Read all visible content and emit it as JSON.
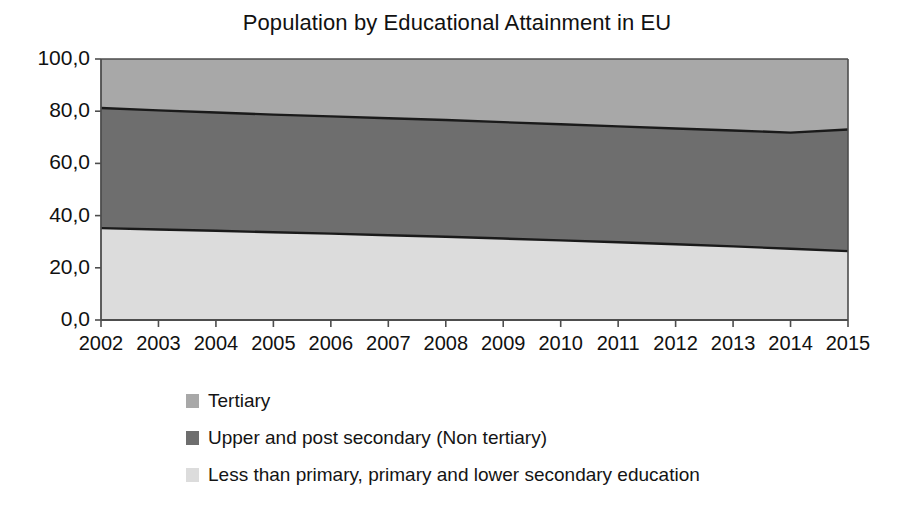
{
  "chart_data": {
    "type": "area",
    "title": "Population by Educational Attainment in EU",
    "subtitle": "",
    "xlabel": "",
    "ylabel": "",
    "stacked": true,
    "normalized_percent": true,
    "grid": false,
    "legend_position": "bottom",
    "xlim": [
      2002,
      2015
    ],
    "ylim": [
      0,
      100
    ],
    "y_ticks": [
      "0,0",
      "20,0",
      "40,0",
      "60,0",
      "80,0",
      "100,0"
    ],
    "y_tick_values": [
      0,
      20,
      40,
      60,
      80,
      100
    ],
    "x": [
      2002,
      2003,
      2004,
      2005,
      2006,
      2007,
      2008,
      2009,
      2010,
      2011,
      2012,
      2013,
      2014,
      2015
    ],
    "categories": [
      "2002",
      "2003",
      "2004",
      "2005",
      "2006",
      "2007",
      "2008",
      "2009",
      "2010",
      "2011",
      "2012",
      "2013",
      "2014",
      "2015"
    ],
    "series": [
      {
        "name": "Less than primary, primary and lower secondary education",
        "color": "#dcdcdc",
        "values": [
          35.2,
          34.7,
          34.2,
          33.6,
          33.1,
          32.5,
          31.9,
          31.2,
          30.5,
          29.8,
          29.0,
          28.2,
          27.3,
          26.4
        ]
      },
      {
        "name": "Upper and post secondary (Non tertiary)",
        "color": "#6e6e6e",
        "values": [
          46.0,
          45.6,
          45.3,
          45.1,
          44.9,
          44.8,
          44.7,
          44.6,
          44.5,
          44.4,
          44.4,
          44.4,
          44.5,
          46.6
        ]
      },
      {
        "name": "Tertiary",
        "color": "#a8a8a8",
        "values": [
          18.8,
          19.7,
          20.5,
          21.3,
          22.0,
          22.7,
          23.4,
          24.2,
          25.0,
          25.8,
          26.6,
          27.4,
          28.2,
          27.0
        ]
      }
    ],
    "cumulative_upper_boundary": [
      81.2,
      80.3,
      79.5,
      78.7,
      78.0,
      77.3,
      76.6,
      75.8,
      75.0,
      74.2,
      73.4,
      72.6,
      71.8,
      73.0
    ],
    "cumulative_lower_boundary": [
      35.2,
      34.7,
      34.2,
      33.6,
      33.1,
      32.5,
      31.9,
      31.2,
      30.5,
      29.8,
      29.0,
      28.2,
      27.3,
      26.4
    ]
  },
  "legend": {
    "items": [
      {
        "label": "Tertiary",
        "color": "#a8a8a8",
        "swatch_name": "legend-swatch-tertiary"
      },
      {
        "label": "Upper and post secondary (Non tertiary)",
        "color": "#6e6e6e",
        "swatch_name": "legend-swatch-upper-post-secondary"
      },
      {
        "label": "Less than primary, primary and lower secondary education",
        "color": "#dcdcdc",
        "swatch_name": "legend-swatch-less-than-primary"
      }
    ]
  },
  "axes": {
    "line_color": "#4d4d4d",
    "boundary_line_color": "#1a1a1a"
  }
}
